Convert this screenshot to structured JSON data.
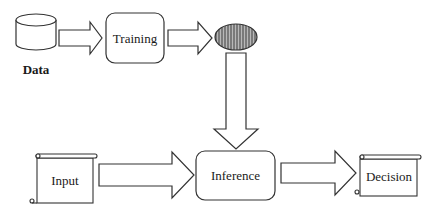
{
  "diagram": {
    "nodes": {
      "data": {
        "label": "Data",
        "shape": "cylinder-icon"
      },
      "training": {
        "label": "Training",
        "shape": "rounded-rect"
      },
      "model": {
        "label": "",
        "shape": "neural-net-ellipse-icon"
      },
      "input": {
        "label": "Input",
        "shape": "scroll"
      },
      "inference": {
        "label": "Inference",
        "shape": "rounded-rect"
      },
      "decision": {
        "label": "Decision",
        "shape": "scroll"
      }
    },
    "edges": [
      {
        "from": "data",
        "to": "training"
      },
      {
        "from": "training",
        "to": "model"
      },
      {
        "from": "model",
        "to": "inference"
      },
      {
        "from": "input",
        "to": "inference"
      },
      {
        "from": "inference",
        "to": "decision"
      }
    ],
    "colors": {
      "stroke": "#333333",
      "fill": "#ffffff",
      "model_fill": "#8a8a8a"
    }
  }
}
